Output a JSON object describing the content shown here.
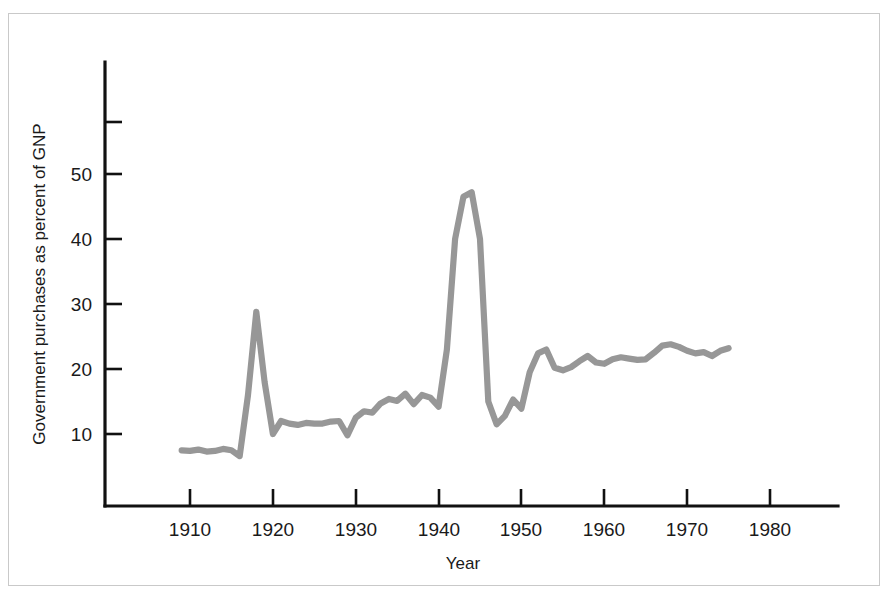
{
  "figure": {
    "background_color": "#ffffff",
    "frame_color": "#c9c9c9",
    "axis_color": "#111111",
    "line_color": "#979797"
  },
  "labels": {
    "y_axis_title": "Government purchases as percent of GNP",
    "x_axis_title": "Year",
    "y_tick_10": "10",
    "y_tick_20": "20",
    "y_tick_30": "30",
    "y_tick_40": "40",
    "y_tick_50": "50",
    "x_tick_1910": "1910",
    "x_tick_1920": "1920",
    "x_tick_1930": "1930",
    "x_tick_1940": "1940",
    "x_tick_1950": "1950",
    "x_tick_1960": "1960",
    "x_tick_1970": "1970",
    "x_tick_1980": "1980"
  },
  "chart_data": {
    "type": "line",
    "title": "",
    "subtitle": "",
    "xlabel": "Year",
    "ylabel": "Government purchases as percent of GNP",
    "xlim": [
      1905,
      1985
    ],
    "ylim": [
      0,
      60
    ],
    "xticks": [
      1910,
      1920,
      1930,
      1940,
      1950,
      1960,
      1970,
      1980
    ],
    "yticks": [
      10,
      20,
      30,
      40,
      50
    ],
    "yticks_unlabeled": [
      58
    ],
    "grid": false,
    "legend": false,
    "series": [
      {
        "name": "Government purchases as percent of GNP",
        "color": "#979797",
        "x": [
          1909,
          1910,
          1911,
          1912,
          1913,
          1914,
          1915,
          1916,
          1917,
          1918,
          1919,
          1920,
          1921,
          1922,
          1923,
          1924,
          1925,
          1926,
          1927,
          1928,
          1929,
          1930,
          1931,
          1932,
          1933,
          1934,
          1935,
          1936,
          1937,
          1938,
          1939,
          1940,
          1941,
          1942,
          1943,
          1944,
          1945,
          1946,
          1947,
          1948,
          1949,
          1950,
          1951,
          1952,
          1953,
          1954,
          1955,
          1956,
          1957,
          1958,
          1959,
          1960,
          1961,
          1962,
          1963,
          1964,
          1965,
          1966,
          1967,
          1968,
          1969,
          1970,
          1971,
          1972,
          1973,
          1974,
          1975
        ],
        "values": [
          7.5,
          7.4,
          7.6,
          7.3,
          7.4,
          7.7,
          7.5,
          6.6,
          16.0,
          28.8,
          18.0,
          10.0,
          12.0,
          11.6,
          11.4,
          11.7,
          11.6,
          11.6,
          11.9,
          12.0,
          9.8,
          12.5,
          13.5,
          13.3,
          14.7,
          15.4,
          15.1,
          16.2,
          14.6,
          16.0,
          15.6,
          14.2,
          23.0,
          40.0,
          46.5,
          47.2,
          40.0,
          15.0,
          11.5,
          12.8,
          15.3,
          13.9,
          19.5,
          22.4,
          23.0,
          20.2,
          19.8,
          20.3,
          21.2,
          22.0,
          21.0,
          20.8,
          21.5,
          21.8,
          21.6,
          21.4,
          21.5,
          22.5,
          23.6,
          23.8,
          23.4,
          22.8,
          22.4,
          22.6,
          22.0,
          22.8,
          23.2
        ]
      }
    ]
  }
}
